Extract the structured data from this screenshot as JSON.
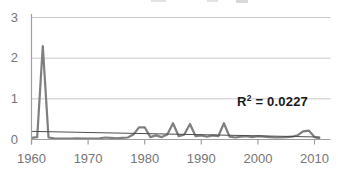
{
  "chart_data": {
    "type": "line",
    "title": "",
    "xlabel": "",
    "ylabel": "",
    "grid": true,
    "legend": "none",
    "xlim": [
      1960,
      2012.8
    ],
    "ylim": [
      0,
      3
    ],
    "xticks": [
      1960,
      1970,
      1980,
      1990,
      2000,
      2010
    ],
    "yticks": [
      0,
      1,
      2,
      3
    ],
    "x": [
      1960,
      1961,
      1962,
      1963,
      1964,
      1965,
      1966,
      1967,
      1968,
      1969,
      1970,
      1971,
      1972,
      1973,
      1974,
      1975,
      1976,
      1977,
      1978,
      1979,
      1980,
      1981,
      1982,
      1983,
      1984,
      1985,
      1986,
      1987,
      1988,
      1989,
      1990,
      1991,
      1992,
      1993,
      1994,
      1995,
      1996,
      1997,
      1998,
      1999,
      2000,
      2001,
      2002,
      2003,
      2004,
      2005,
      2006,
      2007,
      2008,
      2009,
      2010,
      2011
    ],
    "series": [
      {
        "name": "annual series",
        "values": [
          0.04,
          0.06,
          2.3,
          0.05,
          0.03,
          0.02,
          0.02,
          0.02,
          0.03,
          0.02,
          0.02,
          0.02,
          0.03,
          0.05,
          0.04,
          0.03,
          0.04,
          0.05,
          0.12,
          0.3,
          0.3,
          0.06,
          0.1,
          0.06,
          0.12,
          0.4,
          0.08,
          0.12,
          0.38,
          0.08,
          0.1,
          0.07,
          0.1,
          0.08,
          0.4,
          0.07,
          0.05,
          0.07,
          0.08,
          0.06,
          0.08,
          0.07,
          0.06,
          0.05,
          0.05,
          0.06,
          0.07,
          0.1,
          0.2,
          0.22,
          0.06,
          0.03
        ]
      }
    ],
    "trendline": {
      "x1": 1960,
      "y1": 0.2,
      "x2": 2011,
      "y2": 0.06,
      "r_squared": 0.0227
    },
    "colors": {
      "series": "#7f7f7f",
      "trendline": "#4d4d4d",
      "gridline": "#c8c8c8",
      "axis": "#9e9e9e",
      "tick_label": "#767676",
      "annotation": "#1a1a1a"
    }
  },
  "annotation": {
    "prefix": "R",
    "exponent": "2",
    "rest": " = 0.0227"
  }
}
